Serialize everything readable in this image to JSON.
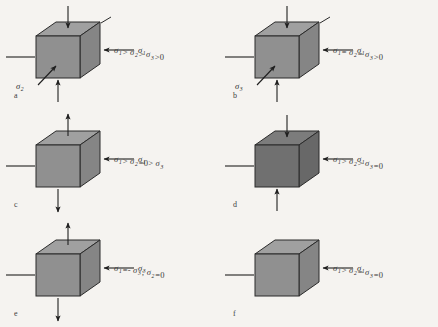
{
  "figure": {
    "background_color": "#f5f3f0",
    "panel_count": 6
  },
  "colors": {
    "cube_front_normal": "#909090",
    "cube_top_normal": "#a0a0a0",
    "cube_side_normal": "#858585",
    "cube_front_dark": "#707070",
    "cube_top_dark": "#7c7c7c",
    "cube_side_dark": "#686868",
    "outline": "#2b2b2b",
    "arrow": "#1f1f1f",
    "text": "#3a3a3a"
  },
  "panels": [
    {
      "letter": "a",
      "shade": "normal",
      "vertical_arrow_direction": "inward",
      "has_vertical_arrows": true,
      "has_diagonal_arrow": true,
      "has_corner_tick": true,
      "top_label": {
        "symbol": "σ",
        "subscript": "3"
      },
      "right_label": {
        "symbol": "σ",
        "subscript": "1"
      },
      "front_label": {
        "symbol": "σ",
        "subscript": "2"
      },
      "formula": "σ₁ > σ₂ > σ₃ > 0",
      "formula_parts": [
        {
          "sym": "σ",
          "sub": "1"
        },
        {
          "op": ">"
        },
        {
          "sym": "σ",
          "sub": "2"
        },
        {
          "op": ">"
        },
        {
          "sym": "σ",
          "sub": "3"
        },
        {
          "op": ">0"
        }
      ]
    },
    {
      "letter": "b",
      "shade": "normal",
      "vertical_arrow_direction": "inward",
      "has_vertical_arrows": true,
      "has_diagonal_arrow": true,
      "has_corner_tick": true,
      "top_label": {
        "symbol": "σ",
        "subscript": "2"
      },
      "right_label": {
        "symbol": "σ",
        "subscript": "1"
      },
      "front_label": {
        "symbol": "σ",
        "subscript": "3"
      },
      "formula": "σ₁ = σ₂ = σ₃ > 0",
      "formula_parts": [
        {
          "sym": "σ",
          "sub": "1"
        },
        {
          "op": "="
        },
        {
          "sym": "σ",
          "sub": "2"
        },
        {
          "op": "="
        },
        {
          "sym": "σ",
          "sub": "3"
        },
        {
          "op": ">0"
        }
      ]
    },
    {
      "letter": "c",
      "shade": "normal",
      "vertical_arrow_direction": "outward",
      "has_vertical_arrows": true,
      "has_diagonal_arrow": false,
      "has_corner_tick": false,
      "top_label": {
        "symbol": "σ",
        "subscript": "1"
      },
      "right_label": {
        "symbol": "σ",
        "subscript": "1"
      },
      "front_label": null,
      "formula": "σ₁ > σ₂ = 0 > σ₃",
      "formula_parts": [
        {
          "sym": "σ",
          "sub": "1"
        },
        {
          "op": ">"
        },
        {
          "sym": "σ",
          "sub": "2"
        },
        {
          "op": "=0>"
        },
        {
          "sym": "σ",
          "sub": "3"
        }
      ]
    },
    {
      "letter": "d",
      "shade": "dark",
      "vertical_arrow_direction": "inward",
      "has_vertical_arrows": true,
      "has_diagonal_arrow": false,
      "has_corner_tick": false,
      "top_label": {
        "symbol": "σ",
        "subscript": "2"
      },
      "right_label": {
        "symbol": "σ",
        "subscript": "1"
      },
      "front_label": null,
      "formula": "σ₁ > σ₂ > σ₃ = 0",
      "formula_parts": [
        {
          "sym": "σ",
          "sub": "1"
        },
        {
          "op": ">"
        },
        {
          "sym": "σ",
          "sub": "2"
        },
        {
          "op": ">"
        },
        {
          "sym": "σ",
          "sub": "3"
        },
        {
          "op": "=0"
        }
      ]
    },
    {
      "letter": "e",
      "shade": "normal",
      "vertical_arrow_direction": "outward",
      "has_vertical_arrows": true,
      "has_diagonal_arrow": false,
      "has_corner_tick": false,
      "top_label": {
        "symbol": "σ",
        "subscript": "3"
      },
      "right_label": {
        "symbol": "σ",
        "subscript": "3"
      },
      "front_label": null,
      "formula": "σ₁ = - σ₃; σ₂ = 0",
      "formula_parts": [
        {
          "sym": "σ",
          "sub": "1"
        },
        {
          "op": "=-"
        },
        {
          "sym": "σ",
          "sub": "3"
        },
        {
          "op": ";"
        },
        {
          "sym": "σ",
          "sub": "2"
        },
        {
          "op": "=0"
        }
      ]
    },
    {
      "letter": "f",
      "shade": "normal",
      "vertical_arrow_direction": "none",
      "has_vertical_arrows": false,
      "has_diagonal_arrow": false,
      "has_corner_tick": false,
      "top_label": null,
      "right_label": {
        "symbol": "σ",
        "subscript": "1"
      },
      "front_label": null,
      "formula": "σ₁ > σ₂ = σ₃ = 0",
      "formula_parts": [
        {
          "sym": "σ",
          "sub": "1"
        },
        {
          "op": ">"
        },
        {
          "sym": "σ",
          "sub": "2"
        },
        {
          "op": "="
        },
        {
          "sym": "σ",
          "sub": "3"
        },
        {
          "op": "=0"
        }
      ]
    }
  ]
}
